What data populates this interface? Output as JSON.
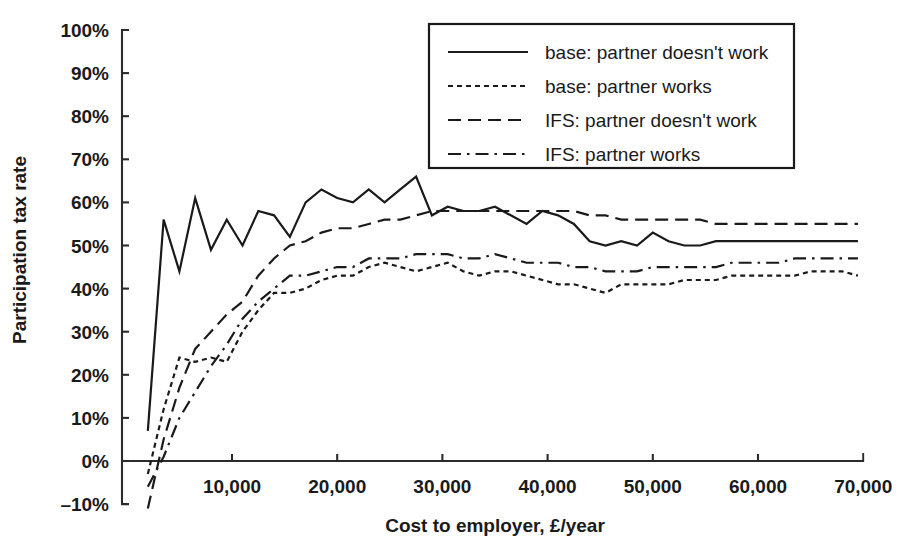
{
  "chart_data": {
    "type": "line",
    "title": "",
    "xlabel": "Cost to employer, £/year",
    "ylabel": "Participation tax rate",
    "xlim": [
      0,
      70000
    ],
    "ylim": [
      -0.1,
      1.0
    ],
    "grid": false,
    "legend_position": "top-right",
    "x_tick_labels": [
      "10,000",
      "20,000",
      "30,000",
      "40,000",
      "50,000",
      "60,000",
      "70,000"
    ],
    "x_tick_values": [
      10000,
      20000,
      30000,
      40000,
      50000,
      60000,
      70000
    ],
    "y_tick_labels": [
      "100%",
      "90%",
      "80%",
      "70%",
      "60%",
      "50%",
      "40%",
      "30%",
      "20%",
      "10%",
      "0%",
      "–10%"
    ],
    "y_tick_values": [
      100,
      90,
      80,
      70,
      60,
      50,
      40,
      30,
      20,
      10,
      0,
      -10
    ],
    "x": [
      2000,
      3500,
      5000,
      6500,
      8000,
      9500,
      11000,
      12500,
      14000,
      15500,
      17000,
      18500,
      20000,
      21500,
      23000,
      24500,
      26000,
      27500,
      29000,
      30500,
      32000,
      33500,
      35000,
      36500,
      38000,
      39500,
      41000,
      42500,
      44000,
      45500,
      47000,
      48500,
      50000,
      51500,
      53000,
      54500,
      56000,
      57500,
      59000,
      60500,
      62000,
      63500,
      65000,
      66500,
      68000,
      69500
    ],
    "series": [
      {
        "name": "base: partner doesn't work",
        "style": "solid",
        "values": [
          7,
          56,
          44,
          61,
          49,
          56,
          50,
          58,
          57,
          52,
          60,
          63,
          61,
          60,
          63,
          60,
          63,
          66,
          57,
          59,
          58,
          58,
          59,
          57,
          55,
          58,
          57,
          55,
          51,
          50,
          51,
          50,
          53,
          51,
          50,
          50,
          51,
          51,
          51,
          51,
          51,
          51,
          51,
          51,
          51,
          51
        ]
      },
      {
        "name": "base: partner works",
        "style": "dotted",
        "values": [
          -3,
          12,
          24,
          23,
          24,
          23,
          30,
          35,
          39,
          39,
          40,
          42,
          43,
          43,
          45,
          46,
          45,
          44,
          45,
          46,
          44,
          43,
          44,
          44,
          43,
          42,
          41,
          41,
          40,
          39,
          41,
          41,
          41,
          41,
          42,
          42,
          42,
          43,
          43,
          43,
          43,
          43,
          44,
          44,
          44,
          43
        ]
      },
      {
        "name": "IFS: partner doesn't work",
        "style": "dashed",
        "values": [
          -11,
          5,
          17,
          26,
          30,
          34,
          37,
          43,
          47,
          50,
          51,
          53,
          54,
          54,
          55,
          56,
          56,
          57,
          58,
          58,
          58,
          58,
          58,
          58,
          58,
          58,
          58,
          58,
          57,
          57,
          56,
          56,
          56,
          56,
          56,
          56,
          55,
          55,
          55,
          55,
          55,
          55,
          55,
          55,
          55,
          55
        ]
      },
      {
        "name": "IFS: partner works",
        "style": "dashdot",
        "values": [
          -6,
          1,
          10,
          16,
          22,
          27,
          33,
          37,
          40,
          43,
          43,
          44,
          45,
          45,
          47,
          47,
          47,
          48,
          48,
          48,
          47,
          47,
          48,
          47,
          46,
          46,
          46,
          45,
          45,
          44,
          44,
          44,
          45,
          45,
          45,
          45,
          45,
          46,
          46,
          46,
          46,
          47,
          47,
          47,
          47,
          47
        ]
      }
    ]
  },
  "legend": {
    "entries": [
      {
        "label": "base: partner doesn't work",
        "style": "solid"
      },
      {
        "label": "base: partner works",
        "style": "dotted"
      },
      {
        "label": "IFS: partner doesn't work",
        "style": "dashed"
      },
      {
        "label": "IFS: partner works",
        "style": "dashdot"
      }
    ]
  },
  "colors": {
    "ink": "#1a1a1a",
    "axis": "#2b2b2b",
    "background": "#ffffff"
  }
}
